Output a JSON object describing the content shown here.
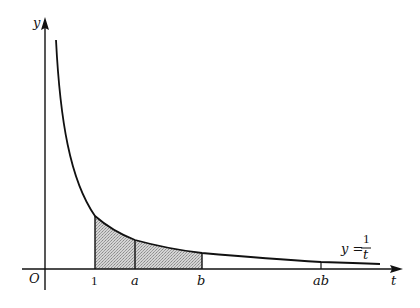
{
  "diagram": {
    "type": "area-under-curve",
    "function": "y = 1/t",
    "axes": {
      "x_label": "t",
      "y_label": "y",
      "origin_label": "O"
    },
    "ticks": [
      {
        "label": "1",
        "italic": false,
        "t": 1
      },
      {
        "label": "a",
        "italic": true,
        "t": 1.8
      },
      {
        "label": "b",
        "italic": true,
        "t": 3.14
      },
      {
        "label": "ab",
        "italic": true,
        "t": 5.65
      }
    ],
    "curve_label": {
      "lhs": "y =",
      "numerator": "1",
      "denominator": "t"
    },
    "shaded_regions": [
      {
        "from": "1",
        "to": "a"
      },
      {
        "from": "a",
        "to": "b"
      }
    ],
    "colors": {
      "stroke": "#111111",
      "shade": "#bdbdbd",
      "background": "#ffffff"
    }
  }
}
